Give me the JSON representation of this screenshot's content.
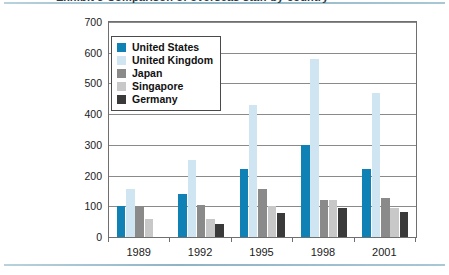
{
  "figure": {
    "header_sliver_text": "Exhibit 3  Comparison of overseas staff by country"
  },
  "chart_data": {
    "type": "bar",
    "title": "",
    "subtitle": "",
    "xlabel": "",
    "ylabel": "",
    "categories": [
      "1989",
      "1992",
      "1995",
      "1998",
      "2001"
    ],
    "series": [
      {
        "name": "United States",
        "color": "#1081b5",
        "values": [
          100,
          140,
          220,
          300,
          220
        ]
      },
      {
        "name": "United Kingdom",
        "color": "#cfe6f2",
        "values": [
          155,
          250,
          430,
          580,
          470
        ]
      },
      {
        "name": "Japan",
        "color": "#8a8a8a",
        "values": [
          100,
          105,
          155,
          120,
          128
        ]
      },
      {
        "name": "Singapore",
        "color": "#c8c8c8",
        "values": [
          60,
          60,
          100,
          120,
          95
        ]
      },
      {
        "name": "Germany",
        "color": "#3a3a3a",
        "values": [
          0,
          42,
          78,
          95,
          80
        ]
      }
    ],
    "ylim": [
      0,
      700
    ],
    "yticks": [
      0,
      100,
      200,
      300,
      400,
      500,
      600,
      700
    ],
    "ytick_labels": [
      "0",
      "100",
      "200",
      "300",
      "400",
      "500",
      "600",
      "700"
    ],
    "grid": true,
    "grid_axis": "y",
    "legend_position": "upper-left-inside"
  }
}
